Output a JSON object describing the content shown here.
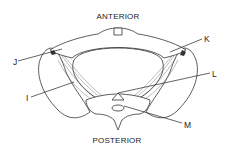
{
  "diagram": {
    "orientation": {
      "top": "ANTERIOR",
      "bottom": "POSTERIOR"
    },
    "labels": [
      {
        "id": "J",
        "text": "J"
      },
      {
        "id": "K",
        "text": "K"
      },
      {
        "id": "L",
        "text": "L"
      },
      {
        "id": "I",
        "text": "I"
      },
      {
        "id": "M",
        "text": "M"
      }
    ]
  }
}
